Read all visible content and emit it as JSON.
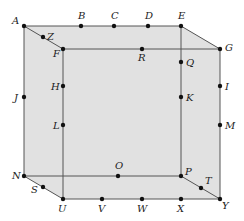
{
  "diagram": {
    "type": "cube-wireframe",
    "colors": {
      "face_fill": "#d9d9d9",
      "edge": "#555555",
      "point": "#111111",
      "label": "#222222"
    },
    "faces": [
      {
        "name": "back-face",
        "vertices": [
          "A",
          "E",
          "P",
          "N"
        ]
      },
      {
        "name": "top-face",
        "vertices": [
          "A",
          "E",
          "G",
          "F"
        ]
      },
      {
        "name": "right-face",
        "vertices": [
          "E",
          "G",
          "Y",
          "P"
        ]
      },
      {
        "name": "front-face",
        "vertices": [
          "F",
          "G",
          "Y",
          "U"
        ]
      },
      {
        "name": "bottom-face",
        "vertices": [
          "N",
          "P",
          "Y",
          "U"
        ]
      },
      {
        "name": "left-face",
        "vertices": [
          "A",
          "F",
          "U",
          "N"
        ]
      }
    ],
    "edges": [
      [
        "A",
        "E"
      ],
      [
        "E",
        "G"
      ],
      [
        "G",
        "Y"
      ],
      [
        "Y",
        "U"
      ],
      [
        "U",
        "N"
      ],
      [
        "N",
        "A"
      ],
      [
        "A",
        "F"
      ],
      [
        "F",
        "G"
      ],
      [
        "F",
        "U"
      ],
      [
        "E",
        "P"
      ],
      [
        "N",
        "P"
      ],
      [
        "P",
        "Y"
      ]
    ],
    "points": [
      {
        "id": "A",
        "label": "A",
        "x": 24,
        "y": 26,
        "lx": 12,
        "ly": 24
      },
      {
        "id": "B",
        "label": "B",
        "x": 81,
        "y": 26,
        "lx": 78,
        "ly": 19
      },
      {
        "id": "C",
        "label": "C",
        "x": 114,
        "y": 26,
        "lx": 111,
        "ly": 19
      },
      {
        "id": "D",
        "label": "D",
        "x": 148,
        "y": 26,
        "lx": 145,
        "ly": 19
      },
      {
        "id": "E",
        "label": "E",
        "x": 181,
        "y": 26,
        "lx": 178,
        "ly": 19
      },
      {
        "id": "Z",
        "label": "Z",
        "x": 43,
        "y": 37,
        "lx": 47,
        "ly": 40
      },
      {
        "id": "F",
        "label": "F",
        "x": 63,
        "y": 49,
        "lx": 53,
        "ly": 57
      },
      {
        "id": "R",
        "label": "R",
        "x": 142,
        "y": 49,
        "lx": 138,
        "ly": 61
      },
      {
        "id": "G",
        "label": "G",
        "x": 220,
        "y": 49,
        "lx": 225,
        "ly": 51
      },
      {
        "id": "Q",
        "label": "Q",
        "x": 181,
        "y": 62,
        "lx": 186,
        "ly": 66
      },
      {
        "id": "H",
        "label": "H",
        "x": 63,
        "y": 86,
        "lx": 51,
        "ly": 90
      },
      {
        "id": "I",
        "label": "I",
        "x": 220,
        "y": 86,
        "lx": 225,
        "ly": 90
      },
      {
        "id": "J",
        "label": "J",
        "x": 24,
        "y": 97,
        "lx": 14,
        "ly": 101
      },
      {
        "id": "K",
        "label": "K",
        "x": 181,
        "y": 97,
        "lx": 186,
        "ly": 101
      },
      {
        "id": "L",
        "label": "L",
        "x": 63,
        "y": 125,
        "lx": 53,
        "ly": 129
      },
      {
        "id": "M",
        "label": "M",
        "x": 220,
        "y": 125,
        "lx": 225,
        "ly": 129
      },
      {
        "id": "O",
        "label": "O",
        "x": 118,
        "y": 176,
        "lx": 115,
        "ly": 169
      },
      {
        "id": "N",
        "label": "N",
        "x": 24,
        "y": 176,
        "lx": 12,
        "ly": 179
      },
      {
        "id": "P",
        "label": "P",
        "x": 181,
        "y": 176,
        "lx": 185,
        "ly": 175
      },
      {
        "id": "S",
        "label": "S",
        "x": 43,
        "y": 187,
        "lx": 31,
        "ly": 193
      },
      {
        "id": "T",
        "label": "T",
        "x": 201,
        "y": 188,
        "lx": 205,
        "ly": 184
      },
      {
        "id": "U",
        "label": "U",
        "x": 63,
        "y": 199,
        "lx": 58,
        "ly": 212
      },
      {
        "id": "V",
        "label": "V",
        "x": 102,
        "y": 199,
        "lx": 98,
        "ly": 212
      },
      {
        "id": "W",
        "label": "W",
        "x": 142,
        "y": 199,
        "lx": 137,
        "ly": 212
      },
      {
        "id": "X",
        "label": "X",
        "x": 181,
        "y": 199,
        "lx": 177,
        "ly": 212
      },
      {
        "id": "Y",
        "label": "Y",
        "x": 220,
        "y": 199,
        "lx": 222,
        "ly": 209
      }
    ]
  }
}
